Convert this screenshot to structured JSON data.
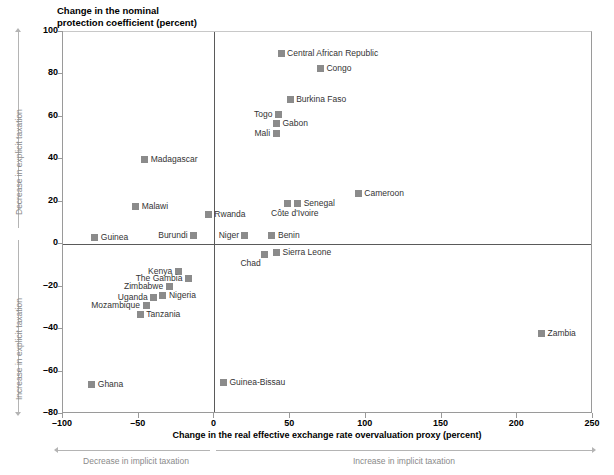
{
  "chart_data": {
    "type": "scatter",
    "title": "Change in the nominal\nprotection coefficient (percent)",
    "xlabel": "Change in the real effective exchange rate overvaluation proxy (percent)",
    "ylabel": "Change in the nominal protection coefficient (percent)",
    "xlim": [
      -100,
      250
    ],
    "ylim": [
      -80,
      100
    ],
    "xticks": [
      -100,
      -50,
      0,
      50,
      100,
      150,
      200,
      250
    ],
    "xtick_labels": [
      "–100",
      "–50",
      "0",
      "50",
      "100",
      "150",
      "200",
      "250"
    ],
    "yticks": [
      100,
      80,
      60,
      40,
      20,
      0,
      -20,
      -40,
      -60,
      -80
    ],
    "ytick_labels": [
      "100",
      "80",
      "60",
      "40",
      "20",
      "0",
      "–20",
      "–40",
      "–60",
      "–80"
    ],
    "grid": false,
    "legend": "none",
    "marker_color": "#8b8b8b",
    "zero_line_color": "#5a5a5a",
    "annotations": {
      "y_top": "Decrease in explicit taxation",
      "y_bottom": "Increase in explicit taxation",
      "x_left": "Decrease in implicit taxation",
      "x_right": "Increase in implicit taxation"
    },
    "points": [
      {
        "label": "Central African Republic",
        "x": 44,
        "y": 90,
        "label_pos": "right"
      },
      {
        "label": "Congo",
        "x": 70,
        "y": 83,
        "label_pos": "right"
      },
      {
        "label": "Burkina Faso",
        "x": 50,
        "y": 68,
        "label_pos": "right"
      },
      {
        "label": "Togo",
        "x": 42,
        "y": 61,
        "label_pos": "left"
      },
      {
        "label": "Gabon",
        "x": 41,
        "y": 57,
        "label_pos": "right"
      },
      {
        "label": "Mali",
        "x": 41,
        "y": 52,
        "label_pos": "left"
      },
      {
        "label": "Madagascar",
        "x": -46,
        "y": 40,
        "label_pos": "right"
      },
      {
        "label": "Cameroon",
        "x": 95,
        "y": 24,
        "label_pos": "right"
      },
      {
        "label": "Malawi",
        "x": -52,
        "y": 18,
        "label_pos": "right"
      },
      {
        "label": "Senegal",
        "x": 55,
        "y": 19,
        "label_pos": "right"
      },
      {
        "label": "Côte d'Ivoire",
        "x": 48,
        "y": 19,
        "label_pos": "below"
      },
      {
        "label": "Rwanda",
        "x": -4,
        "y": 14,
        "label_pos": "right"
      },
      {
        "label": "Guinea",
        "x": -79,
        "y": 3,
        "label_pos": "right"
      },
      {
        "label": "Burundi",
        "x": -14,
        "y": 4,
        "label_pos": "left"
      },
      {
        "label": "Niger",
        "x": 20,
        "y": 4,
        "label_pos": "left"
      },
      {
        "label": "Benin",
        "x": 38,
        "y": 4,
        "label_pos": "right"
      },
      {
        "label": "Chad",
        "x": 33,
        "y": -5,
        "label_pos": "below-left"
      },
      {
        "label": "Sierra Leone",
        "x": 41,
        "y": -4,
        "label_pos": "right"
      },
      {
        "label": "Kenya",
        "x": -24,
        "y": -13,
        "label_pos": "left"
      },
      {
        "label": "The Gambia",
        "x": -17,
        "y": -16,
        "label_pos": "left"
      },
      {
        "label": "Zimbabwe",
        "x": -30,
        "y": -20,
        "label_pos": "left"
      },
      {
        "label": "Nigeria",
        "x": -34,
        "y": -24,
        "label_pos": "right"
      },
      {
        "label": "Uganda",
        "x": -40,
        "y": -25,
        "label_pos": "left"
      },
      {
        "label": "Mozambique",
        "x": -45,
        "y": -29,
        "label_pos": "left"
      },
      {
        "label": "Tanzania",
        "x": -49,
        "y": -33,
        "label_pos": "right"
      },
      {
        "label": "Zambia",
        "x": 216,
        "y": -42,
        "label_pos": "right"
      },
      {
        "label": "Ghana",
        "x": -81,
        "y": -66,
        "label_pos": "right"
      },
      {
        "label": "Guinea-Bissau",
        "x": 6,
        "y": -65,
        "label_pos": "right"
      }
    ]
  }
}
